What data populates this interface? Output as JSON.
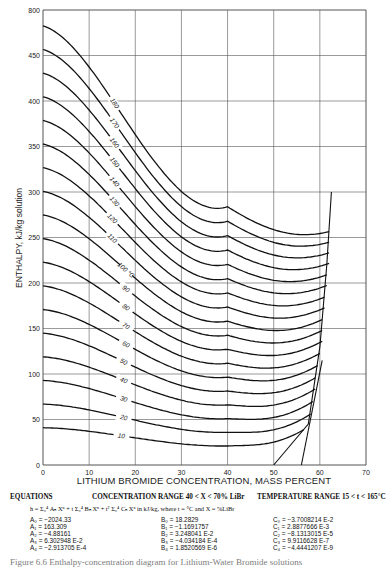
{
  "chart_data": {
    "type": "line",
    "title": "Enthalpy-concentration diagram for Lithium-Water Bromide solutions",
    "xlabel": "LITHIUM BROMIDE CONCENTRATION, MASS PERCENT",
    "ylabel": "ENTHALPY, kJ/kg solution",
    "xlim": [
      0,
      70
    ],
    "ylim": [
      0,
      500
    ],
    "x_ticks": [
      0,
      10,
      20,
      30,
      40,
      50,
      60,
      70
    ],
    "y_ticks": [
      0,
      50,
      100,
      150,
      200,
      250,
      300,
      350,
      400,
      450,
      500
    ],
    "grid": true,
    "series_label": "Isotherms (°C)",
    "isotherms": [
      10,
      20,
      30,
      40,
      50,
      60,
      70,
      80,
      90,
      100,
      110,
      120,
      130,
      140,
      150,
      160,
      170,
      180
    ],
    "isotherm_labels": [
      "10",
      "20",
      "30",
      "40",
      "50",
      "60",
      "70",
      "80",
      "90",
      "100 °C",
      "110",
      "120",
      "130",
      "140",
      "150",
      "160",
      "170",
      "180"
    ],
    "crystallization_line": [
      [
        50,
        0
      ],
      [
        57.5,
        45
      ],
      [
        60,
        130
      ],
      [
        61.5,
        220
      ],
      [
        62.5,
        300
      ]
    ],
    "crystallization_line_2": [
      [
        56,
        0
      ],
      [
        60.5,
        115
      ]
    ],
    "sample_points": {
      "t10": [
        [
          0,
          42
        ],
        [
          20,
          25
        ],
        [
          40,
          12
        ],
        [
          55,
          20
        ],
        [
          60,
          40
        ]
      ],
      "t50": [
        [
          0,
          210
        ],
        [
          20,
          150
        ],
        [
          40,
          118
        ],
        [
          55,
          125
        ],
        [
          60.5,
          150
        ]
      ],
      "t100": [
        [
          0,
          420
        ],
        [
          20,
          320
        ],
        [
          40,
          262
        ],
        [
          55,
          265
        ],
        [
          63,
          315
        ]
      ],
      "t180": [
        [
          30,
          465
        ],
        [
          40,
          400
        ],
        [
          54,
          375
        ],
        [
          70,
          405
        ]
      ]
    }
  },
  "equations": {
    "heading": "EQUATIONS",
    "concentration_range": "CONCENTRATION RANGE 40 < X < 70% LiBr",
    "temperature_range": "TEMPERATURE RANGE 15 < t < 165°C",
    "formula": "h  = Σ₀⁴ Aₙ Xⁿ + t Σ₀⁴ Bₙ Xⁿ + t² Σ₀⁴ Cₙ Xⁿ in kJ/kg, where t = °C and X = %LiBr",
    "A": [
      "A₀ = −2024.33",
      "A₁ =   163.309",
      "A₂ = −4.88161",
      "A₃ =   6.302948 E-2",
      "A₄ = −2.913705 E-4"
    ],
    "B": [
      "B₀ = 18.2829",
      "B₁ = −1.1691757",
      "B₂ =   3.248041 E-2",
      "B₃ = −4.034184 E-4",
      "B₄ =   1.8520569 E-6"
    ],
    "C": [
      "C₀ = −3.7008214 E-2",
      "C₁ =   2.8877666 E-3",
      "C₂ = −8.1313015 E-5",
      "C₃ =   9.9116628 E-7",
      "C₄ = −4.4441207 E-9"
    ],
    "A_values": [
      -2024.33,
      163.309,
      -4.88161,
      0.06302948,
      -0.0002913705
    ],
    "B_values": [
      18.2829,
      -1.1691757,
      0.03248041,
      -0.0004034184,
      1.8520569e-06
    ],
    "C_values": [
      -0.037008214,
      0.0028877666,
      -8.1313015e-05,
      9.9116628e-07,
      -4.4441207e-09
    ]
  },
  "caption": "Figure 6.6  Enthalpy-concentration diagram for Lithium-Water Bromide solutions"
}
